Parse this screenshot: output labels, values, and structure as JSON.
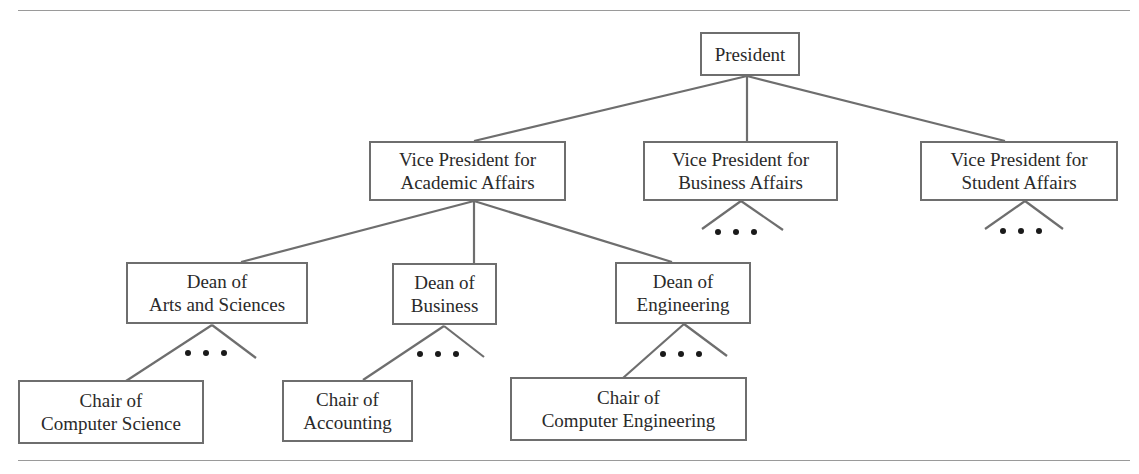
{
  "diagram": {
    "type": "org-chart-tree",
    "colors": {
      "line": "#6e6e6e",
      "border": "#6e6e6e",
      "text": "#2a2a2a",
      "rule": "#9a9a9a"
    },
    "nodes": {
      "president": {
        "lines": [
          "President"
        ]
      },
      "vp_academic": {
        "lines": [
          "Vice President for",
          "Academic Affairs"
        ]
      },
      "vp_business": {
        "lines": [
          "Vice President for",
          "Business Affairs"
        ]
      },
      "vp_student": {
        "lines": [
          "Vice President for",
          "Student Affairs"
        ]
      },
      "dean_arts": {
        "lines": [
          "Dean of",
          "Arts and Sciences"
        ]
      },
      "dean_business": {
        "lines": [
          "Dean of",
          "Business"
        ]
      },
      "dean_engineering": {
        "lines": [
          "Dean of",
          "Engineering"
        ]
      },
      "chair_cs": {
        "lines": [
          "Chair of",
          "Computer Science"
        ]
      },
      "chair_accounting": {
        "lines": [
          "Chair of",
          "Accounting"
        ]
      },
      "chair_ce": {
        "lines": [
          "Chair of",
          "Computer Engineering"
        ]
      }
    },
    "edges": [
      [
        "president",
        "vp_academic"
      ],
      [
        "president",
        "vp_business"
      ],
      [
        "president",
        "vp_student"
      ],
      [
        "vp_academic",
        "dean_arts"
      ],
      [
        "vp_academic",
        "dean_business"
      ],
      [
        "vp_academic",
        "dean_engineering"
      ],
      [
        "dean_arts",
        "chair_cs"
      ],
      [
        "dean_business",
        "chair_accounting"
      ],
      [
        "dean_engineering",
        "chair_ce"
      ]
    ],
    "ellipsis_markers": [
      "vp_business",
      "vp_student",
      "dean_arts",
      "dean_business",
      "dean_engineering"
    ],
    "ellipsis_glyph": "• • •"
  }
}
